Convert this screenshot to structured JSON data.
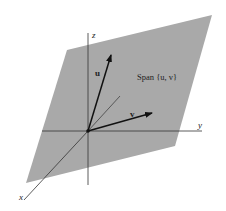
{
  "diagram": {
    "plane_label": "Span {u, v}",
    "vectors": [
      {
        "name": "u",
        "label": "u"
      },
      {
        "name": "v",
        "label": "v"
      }
    ],
    "axes": {
      "x": "x",
      "y": "y",
      "z": "z"
    },
    "colors": {
      "plane": "#a9a9a9",
      "axis": "#333333",
      "vector": "#111111",
      "background": "#ffffff"
    }
  }
}
